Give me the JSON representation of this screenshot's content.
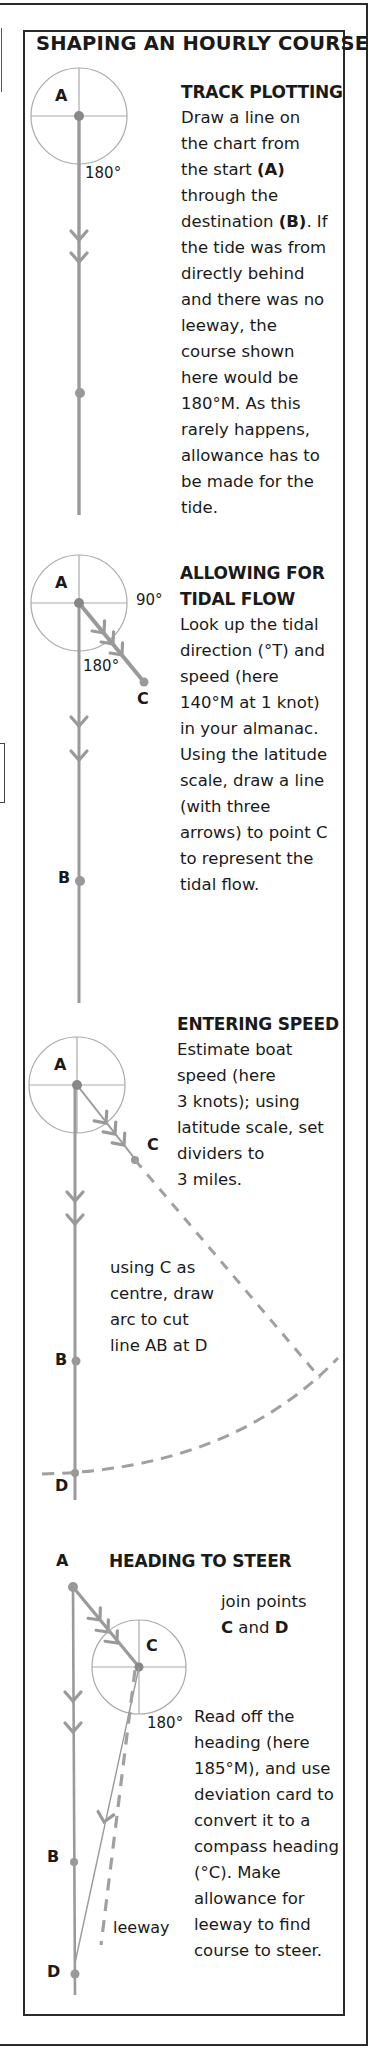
{
  "title": "SHAPING AN HOURLY COURSE",
  "colors": {
    "ink": "#1a1a1a",
    "diagram_line": "#9a9a9a",
    "compass": "#a8a8a8",
    "border": "#2a2a2a"
  },
  "sections": [
    {
      "heading": "TRACK PLOTTING",
      "body_lines": [
        "Draw a line on",
        "the chart from",
        "the start",
        "through the",
        "destination",
        ". If",
        "the tide was from",
        "directly behind",
        "and there was no",
        "leeway, the",
        "course shown",
        "here would be",
        "180°M. As this",
        "rarely happens,",
        "allowance has to",
        "be made for the",
        "tide."
      ],
      "bold_refs": [
        "(A)",
        "(B)"
      ],
      "diagram": {
        "point_a": "A",
        "angle_label": "180°"
      }
    },
    {
      "heading_lines": [
        "ALLOWING FOR",
        "TIDAL FLOW"
      ],
      "body_lines": [
        "Look up the tidal",
        "direction (°T) and",
        "speed (here",
        "140°M at 1 knot)",
        "in your almanac.",
        "Using the latitude",
        "scale, draw a line",
        "(with three",
        "arrows) to point C",
        "to represent the",
        "tidal flow."
      ],
      "diagram": {
        "point_a": "A",
        "point_b": "B",
        "point_c": "C",
        "angle_90": "90°",
        "angle_180": "180°"
      }
    },
    {
      "heading": "ENTERING SPEED",
      "body_lines": [
        "Estimate boat",
        "speed (here",
        "3 knots); using",
        "latitude scale, set",
        "dividers to",
        "3 miles."
      ],
      "note_lines": [
        "using C as",
        "centre, draw",
        "arc to cut",
        "line AB at D"
      ],
      "diagram": {
        "point_a": "A",
        "point_b": "B",
        "point_c": "C",
        "point_d": "D"
      }
    },
    {
      "heading": "HEADING TO STEER",
      "join_lines": [
        "join points",
        "C",
        "and",
        "D"
      ],
      "body_lines": [
        "Read off the",
        "heading (here",
        "185°M), and use",
        "deviation card to",
        "convert it to a",
        "compass heading",
        "(°C). Make",
        "allowance for",
        "leeway to find",
        "course to steer."
      ],
      "diagram": {
        "point_a": "A",
        "point_b": "B",
        "point_c": "C",
        "point_d": "D",
        "angle_180": "180°",
        "leeway_label": "leeway"
      }
    }
  ]
}
